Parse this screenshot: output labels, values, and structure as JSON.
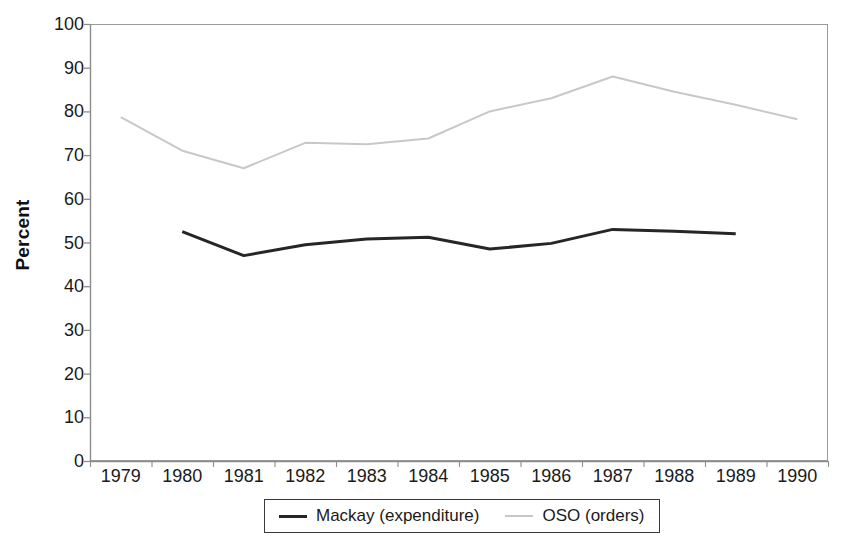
{
  "chart_data": {
    "type": "line",
    "title": "",
    "xlabel": "",
    "ylabel": "Percent",
    "categories": [
      "1979",
      "1980",
      "1981",
      "1982",
      "1983",
      "1984",
      "1985",
      "1986",
      "1987",
      "1988",
      "1989",
      "1990"
    ],
    "ylim": [
      0,
      100
    ],
    "yticks": [
      "0",
      "10",
      "20",
      "30",
      "40",
      "50",
      "60",
      "70",
      "80",
      "90",
      "100"
    ],
    "ytick_values": [
      0,
      10,
      20,
      30,
      40,
      50,
      60,
      70,
      80,
      90,
      100
    ],
    "grid": false,
    "legend_position": "bottom",
    "series": [
      {
        "name": "Mackay (expenditure)",
        "color": "#262626",
        "line_width": 3,
        "x": [
          "1980",
          "1981",
          "1982",
          "1983",
          "1984",
          "1985",
          "1986",
          "1987",
          "1988",
          "1989"
        ],
        "values": [
          52.5,
          47.0,
          49.5,
          50.8,
          51.2,
          48.5,
          49.8,
          53.0,
          52.6,
          52.0
        ]
      },
      {
        "name": "OSO (orders)",
        "color": "#c8c8c8",
        "line_width": 2,
        "x": [
          "1979",
          "1980",
          "1981",
          "1982",
          "1983",
          "1984",
          "1985",
          "1986",
          "1987",
          "1988",
          "1989",
          "1990"
        ],
        "values": [
          78.7,
          71.0,
          67.0,
          72.8,
          72.5,
          73.8,
          80.0,
          83.0,
          88.0,
          84.5,
          81.5,
          78.2
        ]
      }
    ]
  },
  "axes": {
    "y_label": "Percent",
    "y_tick_labels": [
      "100",
      "90",
      "80",
      "70",
      "60",
      "50",
      "40",
      "30",
      "20",
      "10",
      "0"
    ],
    "x_tick_labels": [
      "1979",
      "1980",
      "1981",
      "1982",
      "1983",
      "1984",
      "1985",
      "1986",
      "1987",
      "1988",
      "1989",
      "1990"
    ]
  },
  "legend": {
    "entries": [
      {
        "label": "Mackay (expenditure)",
        "color": "#262626"
      },
      {
        "label": "OSO (orders)",
        "color": "#c8c8c8"
      }
    ]
  },
  "colors": {
    "mackay_line": "#262626",
    "oso_line": "#c8c8c8",
    "axis": "#9a9a9a",
    "text": "#1a1a1a",
    "background": "#ffffff"
  }
}
